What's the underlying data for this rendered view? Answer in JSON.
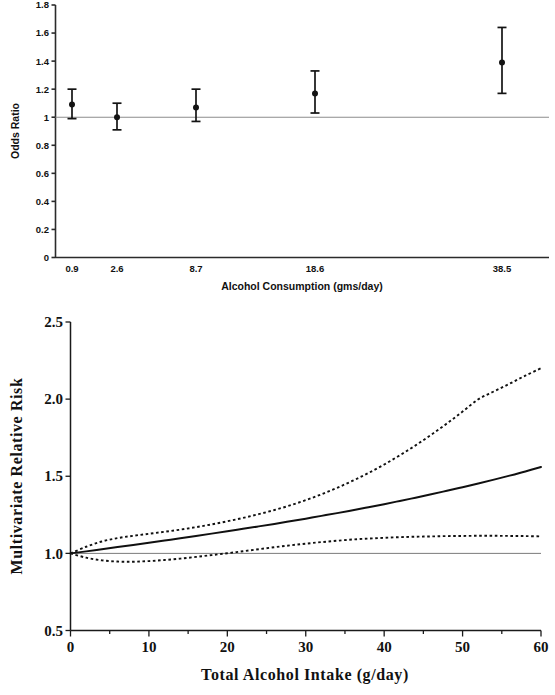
{
  "figure": {
    "panel_count": 2
  },
  "chart_data": [
    {
      "id": "top",
      "type": "scatter",
      "title": "",
      "xlabel": "Alcohol Consumption (gms/day)",
      "ylabel": "Odds Ratio",
      "categories": [
        "0.9",
        "2.6",
        "8.7",
        "18.6",
        "38.5"
      ],
      "x": [
        0.9,
        2.6,
        8.7,
        18.6,
        38.5
      ],
      "values": [
        1.09,
        1.0,
        1.07,
        1.17,
        1.39
      ],
      "ci_low": [
        0.99,
        0.91,
        0.97,
        1.03,
        1.17
      ],
      "ci_high": [
        1.2,
        1.1,
        1.2,
        1.33,
        1.64
      ],
      "reference_line": 1.0,
      "ylim": [
        0,
        1.8
      ],
      "ytick_labels": [
        "0",
        "0.2",
        "0.4",
        "0.6",
        "0.8",
        "1",
        "1.2",
        "1.4",
        "1.6",
        "1.8"
      ],
      "ytick_values": [
        0,
        0.2,
        0.4,
        0.6,
        0.8,
        1.0,
        1.2,
        1.4,
        1.6,
        1.8
      ],
      "xtick_labels": [
        "0.9",
        "2.6",
        "8.7",
        "18.6",
        "38.5"
      ],
      "grid": false,
      "legend": "none",
      "marker": "filled-circle-with-error-bars"
    },
    {
      "id": "bottom",
      "type": "line",
      "title": "",
      "xlabel": "Total Alcohol Intake (g/day)",
      "ylabel": "Multivariate Relative Risk",
      "xlim": [
        0,
        60
      ],
      "ylim": [
        0.5,
        2.5
      ],
      "ytick_labels": [
        "0.5",
        "1.0",
        "1.5",
        "2.0",
        "2.5"
      ],
      "ytick_values": [
        0.5,
        1.0,
        1.5,
        2.0,
        2.5
      ],
      "xtick_labels": [
        "0",
        "10",
        "20",
        "30",
        "40",
        "50",
        "60"
      ],
      "xtick_values": [
        0,
        10,
        20,
        30,
        40,
        50,
        60
      ],
      "xminor_values": [
        5,
        15,
        25,
        35,
        45,
        55
      ],
      "reference_line": 1.0,
      "grid": false,
      "legend": "none",
      "x": [
        0,
        2,
        4,
        6,
        8,
        10,
        12,
        14,
        16,
        18,
        20,
        22,
        24,
        26,
        28,
        30,
        32,
        34,
        36,
        38,
        40,
        42,
        44,
        46,
        48,
        50,
        52,
        54,
        56,
        58,
        60
      ],
      "series": [
        {
          "name": "Relative risk",
          "style": "solid",
          "values": [
            1.0,
            1.013,
            1.027,
            1.041,
            1.055,
            1.069,
            1.083,
            1.098,
            1.113,
            1.128,
            1.143,
            1.159,
            1.175,
            1.191,
            1.208,
            1.225,
            1.243,
            1.261,
            1.28,
            1.299,
            1.319,
            1.34,
            1.361,
            1.383,
            1.406,
            1.429,
            1.453,
            1.478,
            1.504,
            1.531,
            1.56
          ]
        },
        {
          "name": "Upper 95% confidence limit",
          "style": "dotted",
          "values": [
            1.0,
            1.043,
            1.077,
            1.099,
            1.114,
            1.127,
            1.14,
            1.154,
            1.17,
            1.188,
            1.208,
            1.23,
            1.254,
            1.281,
            1.311,
            1.345,
            1.383,
            1.425,
            1.471,
            1.521,
            1.576,
            1.636,
            1.7,
            1.769,
            1.842,
            1.919,
            1.999,
            2.05,
            2.1,
            2.152,
            2.2
          ]
        },
        {
          "name": "Lower 95% confidence limit",
          "style": "dotted",
          "values": [
            1.0,
            0.972,
            0.955,
            0.947,
            0.946,
            0.95,
            0.957,
            0.966,
            0.977,
            0.989,
            1.001,
            1.014,
            1.027,
            1.04,
            1.052,
            1.063,
            1.073,
            1.082,
            1.09,
            1.096,
            1.101,
            1.105,
            1.108,
            1.11,
            1.112,
            1.113,
            1.114,
            1.114,
            1.113,
            1.112,
            1.11
          ]
        }
      ]
    }
  ]
}
